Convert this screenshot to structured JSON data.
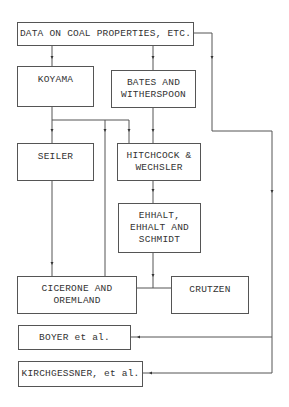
{
  "diagram": {
    "nodes": [
      {
        "id": "data",
        "label": "DATA ON COAL PROPERTIES, ETC."
      },
      {
        "id": "koyama",
        "label": "KOYAMA"
      },
      {
        "id": "bates",
        "label": "BATES AND\nWITHERSPOON"
      },
      {
        "id": "seiler",
        "label": "SEILER"
      },
      {
        "id": "hitchcock",
        "label": "HITCHCOCK &\nWECHSLER"
      },
      {
        "id": "ehhalt",
        "label": "EHHALT,\nEHHALT AND\nSCHMIDT"
      },
      {
        "id": "cicerone",
        "label": "CICERONE AND\nOREMLAND"
      },
      {
        "id": "crutzen",
        "label": "CRUTZEN"
      },
      {
        "id": "boyer",
        "label": "BOYER et al."
      },
      {
        "id": "kirchgessner",
        "label": "KIRCHGESSNER, et al."
      }
    ],
    "edges": [
      {
        "from": "data",
        "to": "koyama"
      },
      {
        "from": "data",
        "to": "bates"
      },
      {
        "from": "data",
        "to": "boyer"
      },
      {
        "from": "data",
        "to": "kirchgessner"
      },
      {
        "from": "koyama",
        "to": "seiler"
      },
      {
        "from": "koyama",
        "to": "hitchcock"
      },
      {
        "from": "koyama",
        "to": "cicerone"
      },
      {
        "from": "bates",
        "to": "hitchcock"
      },
      {
        "from": "hitchcock",
        "to": "ehhalt"
      },
      {
        "from": "seiler",
        "to": "cicerone"
      },
      {
        "from": "ehhalt",
        "to": "cicerone"
      },
      {
        "from": "ehhalt",
        "to": "crutzen"
      }
    ]
  }
}
